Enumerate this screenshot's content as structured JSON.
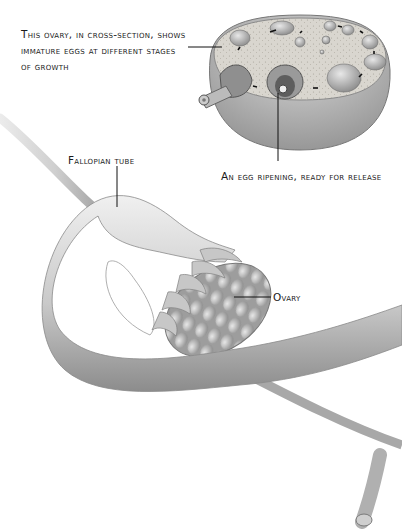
{
  "figure": {
    "colors": {
      "background": "#ffffff",
      "ink": "#1a1a1a",
      "tissue_light": "#e4e4e4",
      "tissue_mid": "#b8b8b8",
      "tissue_dark": "#7a7a7a"
    }
  },
  "labels": {
    "cross_section": "This ovary, in cross-section, shows immature eggs at different stages of growth",
    "egg_ripening": "An egg ripening, ready for release",
    "fallopian_tube": "Fallopian tube",
    "ovary": "Ovary"
  }
}
